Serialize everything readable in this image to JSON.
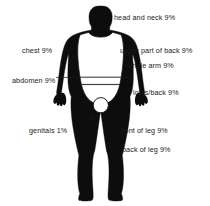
{
  "diagram": {
    "background_color": "#ffffff",
    "figure_color": "#0d0d0d",
    "outline_color": "#1a1a1a",
    "labels": [
      {
        "id": "head-and-neck",
        "text": "head and neck 9%",
        "side": "right",
        "x": 114,
        "y": 13
      },
      {
        "id": "chest",
        "text": "chest 9%",
        "side": "left",
        "x": 22,
        "y": 46
      },
      {
        "id": "upper-part-of-back",
        "text": "upper part of back 9%",
        "side": "right",
        "x": 120,
        "y": 46
      },
      {
        "id": "whole-arm",
        "text": "whole arm 9%",
        "side": "right",
        "x": 127,
        "y": 61
      },
      {
        "id": "abdomen",
        "text": "abdomen 9%",
        "side": "left",
        "x": 12,
        "y": 76
      },
      {
        "id": "loins-back",
        "text": "loins/back 9%",
        "side": "right",
        "x": 133,
        "y": 88
      },
      {
        "id": "genitals",
        "text": "genitals 1%",
        "side": "left",
        "x": 29,
        "y": 126
      },
      {
        "id": "front-of-leg",
        "text": "front of leg 9%",
        "side": "right",
        "x": 120,
        "y": 126
      },
      {
        "id": "back-of-leg",
        "text": "back of leg 9%",
        "side": "right",
        "x": 122,
        "y": 145
      }
    ]
  }
}
